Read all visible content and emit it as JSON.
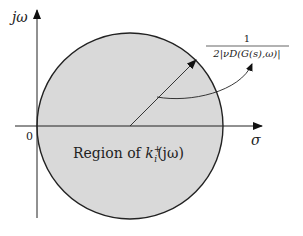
{
  "diagram": {
    "type": "complex-plane region",
    "axes": {
      "vertical_label": "jω",
      "horizontal_label": "σ",
      "origin_label": "0"
    },
    "region": {
      "label_prefix": "Region of ",
      "label_var": "k",
      "label_sub": "i",
      "label_sup": "+",
      "label_arg": "(jω)",
      "fill": "#d9d9d9",
      "stroke": "#222222"
    },
    "radius_annotation": {
      "numerator": "1",
      "denominator": "2|ν_D(G(s),ω)|",
      "denominator_display": "2|νD(G(s),ω)|"
    }
  }
}
